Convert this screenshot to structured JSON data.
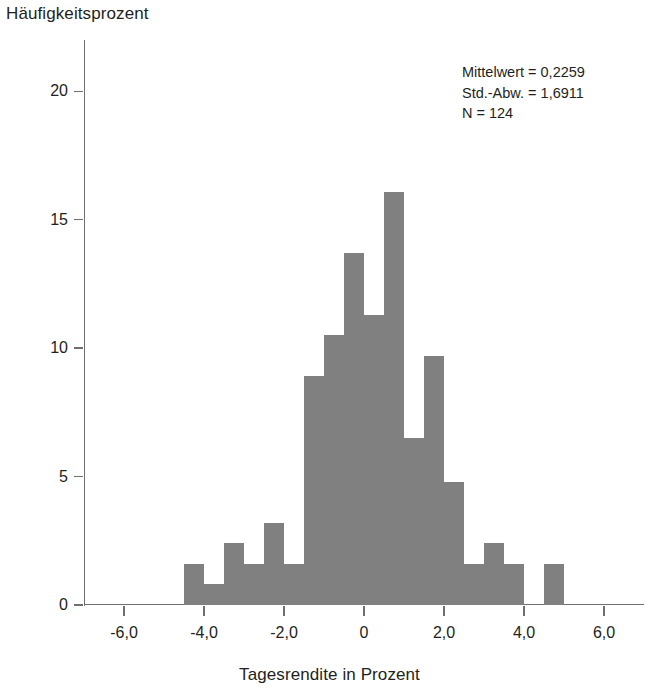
{
  "chart_data": {
    "type": "bar",
    "title": "",
    "ylabel": "Häufigkeitsprozent",
    "xlabel": "Tagesrendite in Prozent",
    "xlim": [
      -7.0,
      7.0
    ],
    "ylim": [
      0,
      22
    ],
    "grid": false,
    "legend": null,
    "bin_width": 0.5,
    "bar_color": "#808080",
    "xticks": [
      -6.0,
      -4.0,
      -2.0,
      0,
      2.0,
      4.0,
      6.0
    ],
    "xtick_labels": [
      "-6,0",
      "-4,0",
      "-2,0",
      "0",
      "2,0",
      "4,0",
      "6,0"
    ],
    "yticks": [
      0,
      5,
      10,
      15,
      20
    ],
    "ytick_labels": [
      "0",
      "5",
      "10",
      "15",
      "20"
    ],
    "bin_centers": [
      -4.25,
      -3.75,
      -3.25,
      -2.75,
      -2.25,
      -1.75,
      -1.25,
      -0.75,
      -0.25,
      0.25,
      0.75,
      1.25,
      1.75,
      2.25,
      2.75,
      3.25,
      3.75,
      4.75
    ],
    "values": [
      1.6,
      0.8,
      2.4,
      1.6,
      3.2,
      1.6,
      8.9,
      10.5,
      13.7,
      11.3,
      16.1,
      6.5,
      9.7,
      4.8,
      1.6,
      2.4,
      1.6,
      1.6
    ],
    "annotations": [
      "Mittelwert = 0,2259",
      "Std.-Abw. = 1,6911",
      "N = 124"
    ]
  },
  "stats": {
    "mean_line": "Mittelwert = 0,2259",
    "stddev_line": "Std.-Abw. = 1,6911",
    "n_line": "N = 124"
  },
  "axes": {
    "y_title": "Häufigkeitsprozent",
    "x_title": "Tagesrendite in Prozent"
  }
}
